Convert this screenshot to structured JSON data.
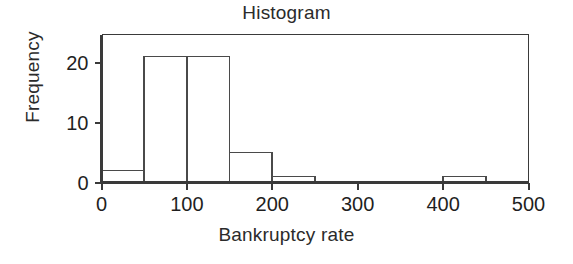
{
  "chart_data": {
    "type": "bar",
    "title": "Histogram",
    "xlabel": "Bankruptcy rate",
    "ylabel": "Frequency",
    "xlim": [
      0,
      500
    ],
    "ylim": [
      0,
      25
    ],
    "grid": false,
    "legend": null,
    "bin_width": 50,
    "bin_edges": [
      0,
      50,
      100,
      150,
      200,
      250,
      300,
      350,
      400,
      450,
      500
    ],
    "categories": [
      "0-50",
      "50-100",
      "100-150",
      "150-200",
      "200-250",
      "250-300",
      "300-350",
      "350-400",
      "400-450",
      "450-500"
    ],
    "values": [
      2,
      21,
      21,
      5,
      1,
      0,
      0,
      0,
      1,
      0
    ],
    "xticks": [
      0,
      100,
      200,
      300,
      400,
      500
    ],
    "xtick_labels": [
      "0",
      "100",
      "200",
      "300",
      "400",
      "500"
    ],
    "yticks": [
      0,
      10,
      20
    ],
    "ytick_labels": [
      "0",
      "10",
      "20"
    ],
    "bar_fill": "#ffffff",
    "bar_edge_color": "#4a4a4a",
    "axis_color": "#3a3a3a",
    "background": "#ffffff"
  }
}
